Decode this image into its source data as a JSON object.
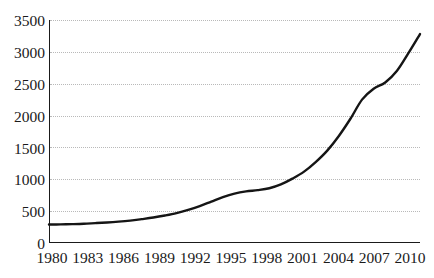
{
  "chart_data": {
    "type": "line",
    "title": "",
    "subtitle": "",
    "xlabel": "",
    "ylabel": "",
    "xlim": [
      1980,
      2012
    ],
    "ylim": [
      0,
      3500
    ],
    "grid": true,
    "grid_style": "dotted-horizontal",
    "legend": "none",
    "line_color": "#151515",
    "grid_color": "#b9b9b9",
    "axis_color": "#1a1a1a",
    "background_color": "#ffffff",
    "xticks": [
      1980,
      1983,
      1986,
      1989,
      1992,
      1995,
      1998,
      2001,
      2004,
      2007,
      2010
    ],
    "xtick_labels": [
      "1980",
      "1983",
      "1986",
      "1989",
      "1992",
      "1995",
      "1998",
      "2001",
      "2004",
      "2007",
      "2010"
    ],
    "yticks": [
      0,
      500,
      1000,
      1500,
      2000,
      2500,
      3000,
      3500
    ],
    "ytick_labels": [
      "0",
      "500",
      "1000",
      "1500",
      "2000",
      "2500",
      "3000",
      "3500"
    ],
    "series": [
      {
        "name": "series-1",
        "x": [
          1980,
          1981,
          1982,
          1983,
          1984,
          1985,
          1986,
          1987,
          1988,
          1989,
          1990,
          1991,
          1992,
          1993,
          1994,
          1995,
          1996,
          1997,
          1998,
          1999,
          2000,
          2001,
          2002,
          2003,
          2004,
          2005,
          2006,
          2007,
          2008,
          2009,
          2010,
          2011,
          2012
        ],
        "values": [
          290,
          292,
          296,
          302,
          312,
          322,
          335,
          352,
          375,
          400,
          432,
          470,
          520,
          580,
          650,
          720,
          775,
          810,
          830,
          860,
          920,
          1010,
          1120,
          1270,
          1450,
          1680,
          1950,
          2250,
          2420,
          2520,
          2700,
          2980,
          3280
        ]
      }
    ]
  }
}
